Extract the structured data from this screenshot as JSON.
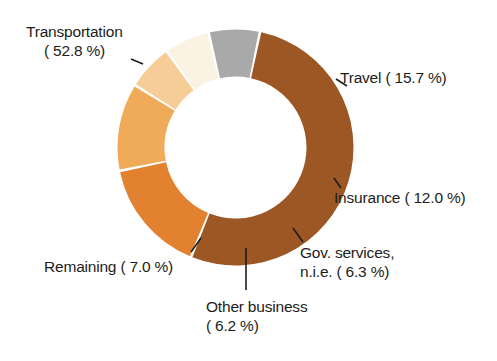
{
  "chart_data": {
    "type": "pie",
    "variant": "donut",
    "title": "",
    "subtitle": "",
    "xlabel": "",
    "ylabel": "",
    "legend_position": "none",
    "grid": false,
    "value_unit": "%",
    "total": 100.0,
    "categories": [
      "Transportation",
      "Travel",
      "Insurance",
      "Gov. services, n.i.e.",
      "Other business",
      "Remaining"
    ],
    "values": [
      52.8,
      15.7,
      12.0,
      6.3,
      6.2,
      7.0
    ],
    "colors": [
      "#9d5725",
      "#e28231",
      "#f0ab59",
      "#f7cd97",
      "#faf3e2",
      "#a9a9a9"
    ],
    "slices": [
      {
        "name": "Transportation",
        "value": 52.8,
        "color": "#9d5725",
        "label_line1": "Transportation",
        "label_line2": "( 52.8 %)"
      },
      {
        "name": "Travel",
        "value": 15.7,
        "color": "#e28231",
        "label_line1": "Travel ( 15.7 %)",
        "label_line2": ""
      },
      {
        "name": "Insurance",
        "value": 12.0,
        "color": "#f0ab59",
        "label_line1": "Insurance ( 12.0 %)",
        "label_line2": ""
      },
      {
        "name": "Gov. services, n.i.e.",
        "value": 6.3,
        "color": "#f7cd97",
        "label_line1": "Gov. services,",
        "label_line2": "n.i.e. ( 6.3 %)"
      },
      {
        "name": "Other business",
        "value": 6.2,
        "color": "#faf3e2",
        "label_line1": "Other business",
        "label_line2": "( 6.2 %)"
      },
      {
        "name": "Remaining",
        "value": 7.0,
        "color": "#a9a9a9",
        "label_line1": "Remaining ( 7.0 %)",
        "label_line2": ""
      }
    ]
  },
  "labels": {
    "transportation": {
      "line1": "Transportation",
      "line2": "( 52.8 %)"
    },
    "travel": {
      "line1": "Travel ( 15.7 %)"
    },
    "insurance": {
      "line1": "Insurance ( 12.0 %)"
    },
    "gov_services": {
      "line1": "Gov. services,",
      "line2": "n.i.e. ( 6.3 %)"
    },
    "other_business": {
      "line1": "Other business",
      "line2": "( 6.2 %)"
    },
    "remaining": {
      "line1": "Remaining ( 7.0 %)"
    }
  }
}
